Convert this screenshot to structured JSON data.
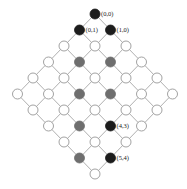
{
  "diagram": {
    "type": "lattice-grid",
    "size": 6,
    "origin": {
      "x": 95,
      "y": 14
    },
    "step": {
      "dx": 15.5,
      "dy": 16
    },
    "node_radius": 5,
    "colors": {
      "edge": "#9a9a9a",
      "empty_fill": "#ffffff",
      "empty_stroke": "#8a8a8a",
      "gray_fill": "#6e6e6e",
      "black_fill": "#1c1c1c"
    },
    "black_nodes": [
      [
        0,
        0
      ],
      [
        0,
        1
      ],
      [
        1,
        0
      ],
      [
        4,
        3
      ],
      [
        5,
        4
      ]
    ],
    "gray_nodes": [
      [
        1,
        2
      ],
      [
        2,
        1
      ],
      [
        2,
        3
      ],
      [
        3,
        2
      ],
      [
        3,
        4
      ],
      [
        4,
        5
      ]
    ],
    "labels": [
      {
        "node": [
          0,
          0
        ],
        "text": "(0,0)"
      },
      {
        "node": [
          0,
          1
        ],
        "text": "(0,1)"
      },
      {
        "node": [
          1,
          0
        ],
        "text": "(1,0)"
      },
      {
        "node": [
          4,
          3
        ],
        "text": "(4,3)"
      },
      {
        "node": [
          5,
          4
        ],
        "text": "(5,4)"
      }
    ]
  }
}
